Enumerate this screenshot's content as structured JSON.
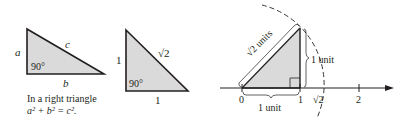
{
  "figure1": {
    "side_a": "a",
    "side_b": "b",
    "side_c": "c",
    "angle": "90°",
    "caption_line1": "In a right triangle",
    "caption_line2": "a² + b² = c²."
  },
  "figure2": {
    "side_vertical": "1",
    "side_horizontal": "1",
    "hypotenuse": "√2",
    "angle": "90°"
  },
  "figure3": {
    "hypotenuse_label": "√2 units",
    "vertical_label": "1 unit",
    "horizontal_label": "1 unit",
    "ticks": [
      "0",
      "1",
      "√2",
      "2"
    ]
  },
  "colors": {
    "fill": "#d9d9d9",
    "stroke": "#231f20"
  }
}
